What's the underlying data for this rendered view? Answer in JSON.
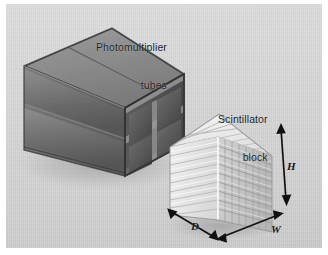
{
  "figure": {
    "background_color": "#d6d6d6",
    "border_color": "#ffffff",
    "width": 328,
    "height": 255
  },
  "labels": {
    "pmt": {
      "line1": "Photomultiplier",
      "line2": "tubes",
      "text": "Photomultiplier tubes"
    },
    "scintillator": {
      "line1": "Scintillator",
      "line2": "block",
      "text": "Scintillator block"
    }
  },
  "dimensions": [
    {
      "id": "height",
      "symbol": "H",
      "arrow": "double-headed-vertical"
    },
    {
      "id": "width",
      "symbol": "W",
      "arrow": "double-headed-diagonal-right"
    },
    {
      "id": "depth",
      "symbol": "D",
      "arrow": "double-headed-diagonal-left"
    }
  ],
  "objects": {
    "pmt_block": {
      "name": "Photomultiplier tube assembly",
      "front_face_grid": {
        "rows": 2,
        "cols": 2
      },
      "top_face_divisions": 2,
      "side_face_bands": 2,
      "colors": {
        "top": "#8c8c8c",
        "left": "#6e6e6e",
        "front": "#4e4e4e",
        "frame": "#9a9a9a",
        "tube_face": "#5a5a5a",
        "edge_dark": "#303030"
      }
    },
    "scintillator_block": {
      "name": "Scintillator crystal block",
      "front_face_grid": {
        "rows": 9,
        "cols": 8
      },
      "left_face_rows": 9,
      "top_face_stripes": 8,
      "colors": {
        "top": "#efefef",
        "left": "#e2e2e2",
        "front": "#c9c9c9",
        "groove": "#a8a8a8",
        "highlight": "#fbfbfb"
      }
    }
  },
  "colors": {
    "arrow": "#111111",
    "text": "#1b1b1b",
    "shadow": "#b4b4b4"
  }
}
